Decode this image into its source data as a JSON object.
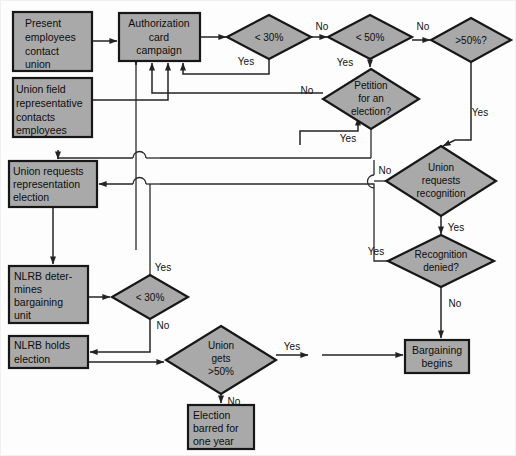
{
  "diagram": {
    "colors": {
      "node_fill": "#a9a9a9",
      "node_stroke": "#171717",
      "connector": "#232323",
      "background": "#fdfdfd",
      "text": "#0d0d0d"
    },
    "process_boxes": [
      {
        "id": "present-employees",
        "lines": [
          "Present",
          "employees",
          "contact",
          "union"
        ],
        "x": 13,
        "y": 12,
        "w": 79,
        "h": 59
      },
      {
        "id": "union-field-rep",
        "lines": [
          "Union field",
          "representative",
          "contacts",
          "employees"
        ],
        "x": 13,
        "y": 78,
        "w": 79,
        "h": 59
      },
      {
        "id": "authorization-card-campaign",
        "lines": [
          "Authorization",
          "card",
          "campaign"
        ],
        "x": 119,
        "y": 13,
        "w": 81,
        "h": 48
      },
      {
        "id": "union-requests-representation-election",
        "lines": [
          "Union requests",
          "representation",
          "election"
        ],
        "x": 9,
        "y": 161,
        "w": 88,
        "h": 46
      },
      {
        "id": "nlrb-determines-bargaining-unit",
        "lines": [
          "NLRB deter-",
          "mines",
          "bargaining",
          "unit"
        ],
        "x": 9,
        "y": 266,
        "w": 79,
        "h": 57
      },
      {
        "id": "nlrb-holds-election",
        "lines": [
          "NLRB holds",
          "election"
        ],
        "x": 9,
        "y": 336,
        "w": 79,
        "h": 32
      },
      {
        "id": "election-barred",
        "lines": [
          "Election",
          "barred for",
          "one year"
        ],
        "x": 188,
        "y": 405,
        "w": 66,
        "h": 44
      },
      {
        "id": "bargaining-begins",
        "lines": [
          "Bargaining",
          "begins"
        ],
        "x": 405,
        "y": 340,
        "w": 64,
        "h": 33
      }
    ],
    "decision_diamonds": [
      {
        "id": "under-30-top",
        "lines": [
          "< 30%"
        ],
        "cx": 269,
        "cy": 37,
        "rx": 42,
        "ry": 22
      },
      {
        "id": "under-50",
        "lines": [
          "< 50%"
        ],
        "cx": 370,
        "cy": 37,
        "rx": 42,
        "ry": 22
      },
      {
        "id": "over-50-question",
        "lines": [
          ">50%?"
        ],
        "cx": 471,
        "cy": 40,
        "rx": 40,
        "ry": 22
      },
      {
        "id": "petition-for-election",
        "lines": [
          "Petition",
          "for an",
          "election?"
        ],
        "cx": 371,
        "cy": 99,
        "rx": 48,
        "ry": 30
      },
      {
        "id": "union-requests-recognition",
        "lines": [
          "Union",
          "requests",
          "recognition"
        ],
        "cx": 441,
        "cy": 181,
        "rx": 55,
        "ry": 35
      },
      {
        "id": "recognition-denied",
        "lines": [
          "Recognition",
          "denied?"
        ],
        "cx": 441,
        "cy": 261,
        "rx": 53,
        "ry": 26
      },
      {
        "id": "under-30-lower",
        "lines": [
          "< 30%"
        ],
        "cx": 150,
        "cy": 297,
        "rx": 38,
        "ry": 22
      },
      {
        "id": "union-gets-over-50",
        "lines": [
          "Union",
          "gets",
          ">50%"
        ],
        "cx": 221,
        "cy": 360,
        "rx": 55,
        "ry": 34
      }
    ],
    "edge_labels": [
      {
        "id": "no-30-to-50",
        "text": "No",
        "x": 322,
        "y": 27
      },
      {
        "id": "no-50-to-over50",
        "text": "No",
        "x": 423,
        "y": 27
      },
      {
        "id": "yes-30-return",
        "text": "Yes",
        "x": 246,
        "y": 62
      },
      {
        "id": "yes-50-to-petition",
        "text": "Yes",
        "x": 345,
        "y": 63
      },
      {
        "id": "no-to-petition",
        "text": "No",
        "x": 307,
        "y": 91
      },
      {
        "id": "yes-petition-down",
        "text": "Yes",
        "x": 348,
        "y": 139
      },
      {
        "id": "yes-over50-down",
        "text": "Yes",
        "x": 478,
        "y": 113
      },
      {
        "id": "no-recognition",
        "text": "No",
        "x": 385,
        "y": 171
      },
      {
        "id": "yes-recognition",
        "text": "Yes",
        "x": 452,
        "y": 228
      },
      {
        "id": "yes-denied-left",
        "text": "Yes",
        "x": 376,
        "y": 252
      },
      {
        "id": "no-denied-down",
        "text": "No",
        "x": 452,
        "y": 304
      },
      {
        "id": "yes-30-lower",
        "text": "Yes",
        "x": 163,
        "y": 268
      },
      {
        "id": "no-30-lower",
        "text": "No",
        "x": 163,
        "y": 323
      },
      {
        "id": "yes-union-gets",
        "text": "Yes",
        "x": 288,
        "y": 349
      },
      {
        "id": "no-union-gets",
        "text": "No",
        "x": 231,
        "y": 392
      }
    ]
  }
}
